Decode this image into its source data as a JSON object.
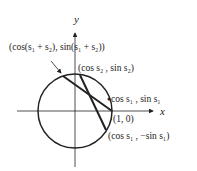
{
  "diagram": {
    "axes": {
      "x_label": "x",
      "y_label": "y"
    },
    "circle": "unit circle",
    "labels": {
      "p_sum": "(cos(s₁ + s₂), sin(s₁ + s₂))",
      "p_s2": "(cos s₂ , sin s₂)",
      "p_s1": "cos s₁ , sin s₁",
      "p_origin": "(1, 0)",
      "p_neg_s1": "(cos s₁ , −sin s₁)"
    },
    "colors": {
      "stroke": "#222222",
      "background": "#ffffff"
    }
  }
}
